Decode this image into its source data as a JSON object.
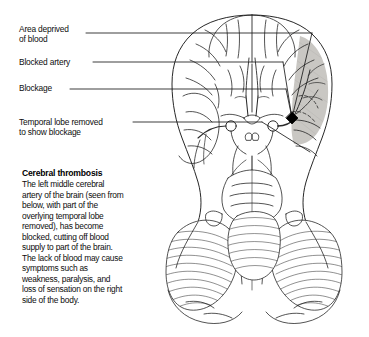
{
  "figure": {
    "callouts": [
      {
        "id": "area-deprived",
        "text": "Area deprived\nof blood"
      },
      {
        "id": "blocked-artery",
        "text": "Blocked artery"
      },
      {
        "id": "blockage",
        "text": "Blockage"
      },
      {
        "id": "temporal-lobe",
        "text": "Temporal lobe removed\nto show blockage"
      }
    ],
    "caption": {
      "title": "Cerebral thrombosis",
      "body": "The left middle cerebral artery of the brain (seen from below, with part of the overlying temporal lobe removed), has become blocked, cutting off blood supply to part of the brain. The lack of blood may cause symptoms such as weakness, paralysis, and loss of sensation on the right side of the body."
    },
    "colors": {
      "ink": "#111111",
      "ischemic_shade": "#c9c7c3",
      "artery": "#2b2b2b",
      "blockage_marker": "#000000",
      "paper": "#ffffff"
    }
  }
}
